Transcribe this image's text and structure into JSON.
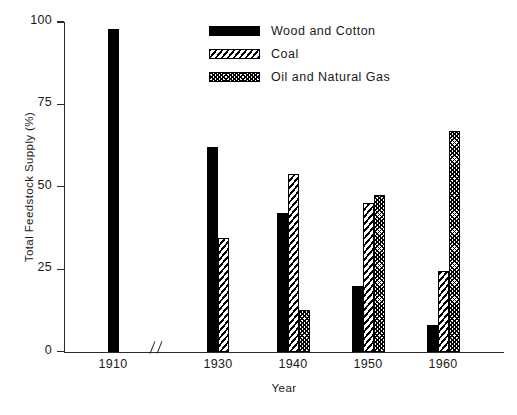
{
  "chart_data": {
    "type": "bar",
    "title": "",
    "xlabel": "Year",
    "ylabel": "Total Feedstock Supply (%)",
    "categories": [
      "1910",
      "1930",
      "1940",
      "1950",
      "1960"
    ],
    "ylim": [
      0,
      100
    ],
    "yticks": [
      0,
      25,
      50,
      75,
      100
    ],
    "ytick_labels": [
      "0",
      "25",
      "50",
      "75",
      "100"
    ],
    "grid": false,
    "legend_position": "top-center",
    "axis_break": {
      "label": "//",
      "between": [
        "1910",
        "1930"
      ]
    },
    "series": [
      {
        "name": "Wood and Cotton",
        "pattern": "solid",
        "values": [
          98,
          62,
          42,
          20,
          8
        ]
      },
      {
        "name": "Coal",
        "pattern": "hatch",
        "values": [
          null,
          34.5,
          54,
          45,
          24.5
        ]
      },
      {
        "name": "Oil and Natural Gas",
        "pattern": "cross",
        "values": [
          null,
          null,
          12.5,
          47.5,
          67
        ]
      }
    ]
  },
  "legend": {
    "items": [
      {
        "label": "Wood and Cotton",
        "pattern": "solid"
      },
      {
        "label": "Coal",
        "pattern": "hatch"
      },
      {
        "label": "Oil and Natural Gas",
        "pattern": "cross"
      }
    ]
  },
  "colors": {
    "ink": "#000000",
    "axis": "#2a2a2a",
    "background": "#ffffff"
  }
}
